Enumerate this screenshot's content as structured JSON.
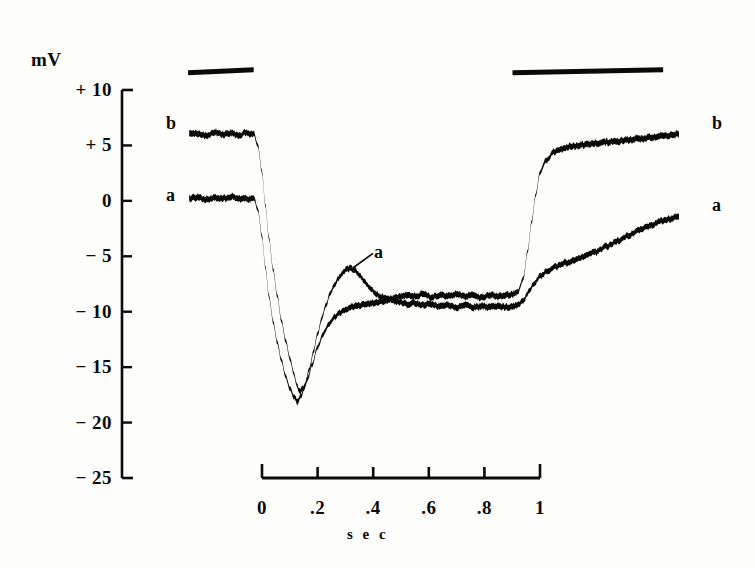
{
  "figure": {
    "background_color": "#fdfdfc",
    "ink_color": "#0a0a0a"
  },
  "axes": {
    "y_unit_label": "mV",
    "y_ticks": [
      "+ 10",
      "+ 5",
      "0",
      "− 5",
      "− 10",
      "− 15",
      "− 20",
      "− 25"
    ],
    "y_tick_values": [
      10,
      5,
      0,
      -5,
      -10,
      -15,
      -20,
      -25
    ],
    "x_ticks": [
      "0",
      ".2",
      ".4",
      ".6",
      ".8",
      "1"
    ],
    "x_tick_values": [
      0,
      0.2,
      0.4,
      0.6,
      0.8,
      1
    ],
    "x_axis_title": "s e c"
  },
  "labels": {
    "left_upper": "b",
    "left_lower": "a",
    "right_upper": "b",
    "right_lower": "a",
    "callout_a": "a"
  },
  "chart_data": {
    "type": "line",
    "title": "",
    "subtitle": "",
    "xlabel": "sec",
    "ylabel": "mV",
    "xlim": [
      -0.27,
      1.6
    ],
    "ylim": [
      -25,
      10
    ],
    "grid": false,
    "legend": "inline-trace-labels",
    "annotations": [
      {
        "text": "a",
        "x": 0.41,
        "y": -4.2,
        "points_to_x": 0.31,
        "points_to_y": -6.3,
        "note": "leader line marks the secondary hump on trace a"
      },
      {
        "text": "mV",
        "x": -0.22,
        "y": 12.4,
        "note": "y axis unit caption"
      }
    ],
    "stimulus_bars": [
      {
        "name": "bar-1",
        "x_start": -0.266,
        "x_end": -0.03,
        "y": 11.9
      },
      {
        "name": "bar-2",
        "x_start": 0.901,
        "x_end": 1.443,
        "y": 11.9
      }
    ],
    "series": [
      {
        "name": "b",
        "label": "b",
        "description": "upper trace: rests near +6 mV, hyperpolarizes to about -17 mV, plateaus near -9 mV, recovers to about +5.5 mV",
        "x": [
          -0.262,
          -0.23,
          -0.2,
          -0.17,
          -0.14,
          -0.11,
          -0.08,
          -0.06,
          -0.045,
          -0.03,
          -0.015,
          0.0,
          0.012,
          0.025,
          0.04,
          0.055,
          0.07,
          0.085,
          0.1,
          0.115,
          0.125,
          0.135,
          0.15,
          0.165,
          0.18,
          0.2,
          0.22,
          0.24,
          0.26,
          0.28,
          0.3,
          0.32,
          0.34,
          0.36,
          0.38,
          0.4,
          0.43,
          0.46,
          0.49,
          0.52,
          0.55,
          0.58,
          0.61,
          0.64,
          0.67,
          0.7,
          0.73,
          0.76,
          0.79,
          0.82,
          0.85,
          0.88,
          0.9,
          0.92,
          0.94,
          0.955,
          0.97,
          0.985,
          1.0,
          1.02,
          1.05,
          1.08,
          1.11,
          1.14,
          1.17,
          1.2,
          1.24,
          1.28,
          1.32,
          1.36,
          1.4,
          1.44,
          1.47,
          1.5
        ],
        "y": [
          6.0,
          6.1,
          5.9,
          6.2,
          6.0,
          6.1,
          5.9,
          6.2,
          6.0,
          6.1,
          5.0,
          2.6,
          -0.4,
          -3.4,
          -6.2,
          -8.6,
          -10.8,
          -12.6,
          -14.2,
          -15.6,
          -16.6,
          -17.2,
          -16.9,
          -16.0,
          -14.8,
          -13.2,
          -12.0,
          -11.1,
          -10.5,
          -10.1,
          -9.8,
          -9.6,
          -9.5,
          -9.4,
          -9.3,
          -9.2,
          -9.1,
          -8.9,
          -8.7,
          -8.5,
          -8.6,
          -8.4,
          -8.7,
          -8.5,
          -8.6,
          -8.4,
          -8.6,
          -8.5,
          -8.7,
          -8.5,
          -8.6,
          -8.5,
          -8.4,
          -8.2,
          -7.0,
          -4.6,
          -1.9,
          0.6,
          2.6,
          3.6,
          4.4,
          4.7,
          4.9,
          5.0,
          5.1,
          5.2,
          5.3,
          5.4,
          5.5,
          5.6,
          5.7,
          5.8,
          5.9,
          6.0
        ]
      },
      {
        "name": "a",
        "label": "a",
        "description": "lower trace: rests near 0 mV, hyperpolarizes to about -18 mV, rebounds to a hump near -6 mV, plateaus near -8.5 mV, recovers to about -1.5 mV",
        "x": [
          -0.262,
          -0.23,
          -0.2,
          -0.17,
          -0.14,
          -0.11,
          -0.08,
          -0.06,
          -0.045,
          -0.03,
          -0.015,
          0.0,
          0.012,
          0.025,
          0.04,
          0.055,
          0.07,
          0.085,
          0.1,
          0.115,
          0.128,
          0.14,
          0.155,
          0.17,
          0.185,
          0.2,
          0.215,
          0.23,
          0.245,
          0.26,
          0.275,
          0.29,
          0.305,
          0.32,
          0.335,
          0.35,
          0.37,
          0.39,
          0.41,
          0.43,
          0.46,
          0.49,
          0.52,
          0.55,
          0.58,
          0.61,
          0.64,
          0.67,
          0.7,
          0.73,
          0.76,
          0.79,
          0.82,
          0.85,
          0.88,
          0.9,
          0.92,
          0.94,
          0.96,
          0.98,
          1.0,
          1.03,
          1.06,
          1.09,
          1.12,
          1.16,
          1.2,
          1.24,
          1.28,
          1.32,
          1.36,
          1.4,
          1.44,
          1.47,
          1.5
        ],
        "y": [
          0.2,
          0.3,
          0.1,
          0.3,
          0.2,
          0.4,
          0.2,
          0.3,
          0.1,
          0.3,
          -0.8,
          -3.2,
          -6.0,
          -8.6,
          -10.9,
          -12.8,
          -14.4,
          -15.8,
          -16.9,
          -17.7,
          -18.1,
          -17.6,
          -16.6,
          -15.2,
          -13.6,
          -12.0,
          -10.6,
          -9.4,
          -8.4,
          -7.6,
          -7.0,
          -6.5,
          -6.2,
          -6.1,
          -6.3,
          -6.7,
          -7.3,
          -7.9,
          -8.4,
          -8.7,
          -8.9,
          -9.1,
          -9.3,
          -9.2,
          -9.4,
          -9.3,
          -9.5,
          -9.4,
          -9.6,
          -9.4,
          -9.6,
          -9.5,
          -9.6,
          -9.5,
          -9.6,
          -9.5,
          -9.4,
          -9.0,
          -8.2,
          -7.4,
          -6.8,
          -6.3,
          -5.9,
          -5.6,
          -5.4,
          -5.0,
          -4.6,
          -4.1,
          -3.6,
          -3.1,
          -2.6,
          -2.2,
          -1.8,
          -1.6,
          -1.4
        ]
      }
    ]
  }
}
